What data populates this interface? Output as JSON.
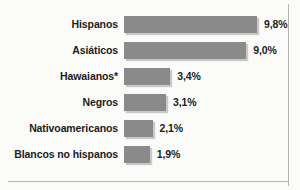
{
  "chart_data": {
    "type": "bar",
    "orientation": "horizontal",
    "title": "",
    "subtitle": "",
    "xlabel": "",
    "ylabel": "",
    "grid": false,
    "legend": null,
    "axis_visible": false,
    "xlim": [
      0,
      9.8
    ],
    "unit": "%",
    "decimal_separator": ",",
    "categories": [
      "Hispanos",
      "Asiáticos",
      "Hawaianos*",
      "Negros",
      "Nativoamericanos",
      "Blancos no hispanos"
    ],
    "values": [
      9.8,
      9.0,
      3.4,
      3.1,
      2.1,
      1.9
    ],
    "value_labels": [
      "9,8%",
      "9,0%",
      "3,4%",
      "3,1%",
      "2,1%",
      "1,9%"
    ],
    "colors": {
      "bar": "#8a8a8a",
      "text": "#1c1c1c",
      "background": "#fbfbfa",
      "border": "#b4b4b4"
    },
    "rows": [
      {
        "category": "Hispanos",
        "value": 9.8,
        "value_label": "9,8%"
      },
      {
        "category": "Asiáticos",
        "value": 9.0,
        "value_label": "9,0%"
      },
      {
        "category": "Hawaianos*",
        "value": 3.4,
        "value_label": "3,4%"
      },
      {
        "category": "Negros",
        "value": 3.1,
        "value_label": "3,1%"
      },
      {
        "category": "Nativoamericanos",
        "value": 2.1,
        "value_label": "2,1%"
      },
      {
        "category": "Blancos no hispanos",
        "value": 1.9,
        "value_label": "1,9%"
      }
    ]
  }
}
